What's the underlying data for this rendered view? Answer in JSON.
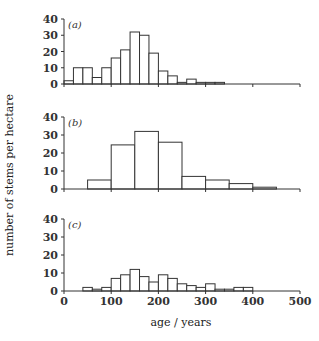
{
  "chart_data": {
    "type": "bar",
    "title": "",
    "xlabel": "age / years",
    "ylabel": "number of stems per hectare",
    "xlim": [
      0,
      500
    ],
    "xticks": [
      0,
      100,
      200,
      300,
      400,
      500
    ],
    "grid": false,
    "legend": null,
    "panels": [
      {
        "label": "(a)",
        "ylim": [
          0,
          40
        ],
        "yticks": [
          0,
          10,
          20,
          30,
          40
        ],
        "bin_width": 20,
        "bins": [
          {
            "start": 0,
            "end": 20,
            "value": 2
          },
          {
            "start": 20,
            "end": 40,
            "value": 10
          },
          {
            "start": 40,
            "end": 60,
            "value": 10
          },
          {
            "start": 60,
            "end": 80,
            "value": 4
          },
          {
            "start": 80,
            "end": 100,
            "value": 10
          },
          {
            "start": 100,
            "end": 120,
            "value": 16
          },
          {
            "start": 120,
            "end": 140,
            "value": 21
          },
          {
            "start": 140,
            "end": 160,
            "value": 32
          },
          {
            "start": 160,
            "end": 180,
            "value": 30
          },
          {
            "start": 180,
            "end": 200,
            "value": 19
          },
          {
            "start": 200,
            "end": 220,
            "value": 8
          },
          {
            "start": 220,
            "end": 240,
            "value": 5
          },
          {
            "start": 240,
            "end": 260,
            "value": 1
          },
          {
            "start": 260,
            "end": 280,
            "value": 3
          },
          {
            "start": 280,
            "end": 300,
            "value": 1
          },
          {
            "start": 300,
            "end": 320,
            "value": 1
          },
          {
            "start": 320,
            "end": 340,
            "value": 1
          }
        ]
      },
      {
        "label": "(b)",
        "ylim": [
          0,
          40
        ],
        "yticks": [
          0,
          10,
          20,
          30,
          40
        ],
        "bin_width": 50,
        "bins": [
          {
            "start": 50,
            "end": 100,
            "value": 5
          },
          {
            "start": 100,
            "end": 150,
            "value": 24.5
          },
          {
            "start": 150,
            "end": 200,
            "value": 32
          },
          {
            "start": 200,
            "end": 250,
            "value": 26
          },
          {
            "start": 250,
            "end": 300,
            "value": 7
          },
          {
            "start": 300,
            "end": 350,
            "value": 5
          },
          {
            "start": 350,
            "end": 400,
            "value": 3
          },
          {
            "start": 400,
            "end": 450,
            "value": 1
          }
        ]
      },
      {
        "label": "(c)",
        "ylim": [
          0,
          40
        ],
        "yticks": [
          0,
          10,
          20,
          30,
          40
        ],
        "bin_width": 20,
        "bins": [
          {
            "start": 40,
            "end": 60,
            "value": 2
          },
          {
            "start": 60,
            "end": 80,
            "value": 1
          },
          {
            "start": 80,
            "end": 100,
            "value": 2
          },
          {
            "start": 100,
            "end": 120,
            "value": 7
          },
          {
            "start": 120,
            "end": 140,
            "value": 9
          },
          {
            "start": 140,
            "end": 160,
            "value": 12
          },
          {
            "start": 160,
            "end": 180,
            "value": 8
          },
          {
            "start": 180,
            "end": 200,
            "value": 5
          },
          {
            "start": 200,
            "end": 220,
            "value": 9
          },
          {
            "start": 220,
            "end": 240,
            "value": 7
          },
          {
            "start": 240,
            "end": 260,
            "value": 4
          },
          {
            "start": 260,
            "end": 280,
            "value": 3
          },
          {
            "start": 280,
            "end": 300,
            "value": 2
          },
          {
            "start": 300,
            "end": 320,
            "value": 4
          },
          {
            "start": 320,
            "end": 340,
            "value": 1
          },
          {
            "start": 340,
            "end": 360,
            "value": 1
          },
          {
            "start": 360,
            "end": 380,
            "value": 2
          },
          {
            "start": 380,
            "end": 400,
            "value": 2
          }
        ]
      }
    ]
  }
}
